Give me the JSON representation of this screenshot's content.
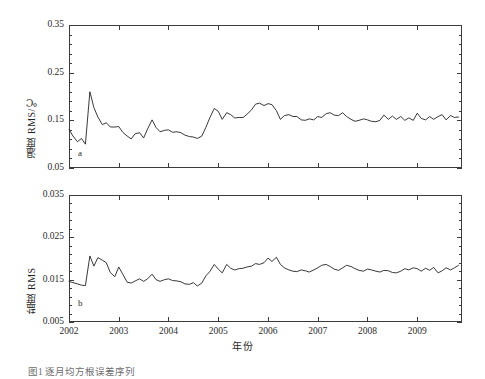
{
  "figure": {
    "background": "#ffffff",
    "line_color": "#222222",
    "axis_color": "#3b3b3b",
    "xlabel": "年份",
    "caption": "图1  逐月均方根误差序列",
    "panels": [
      {
        "letter": "a",
        "ylabel": "温度 RMS/℃"
      },
      {
        "letter": "b",
        "ylabel": "盐度 RMS"
      }
    ]
  },
  "chart_data": [
    {
      "type": "line",
      "title": "",
      "panel": "a",
      "xlabel": "年份",
      "ylabel": "温度 RMS/℃",
      "xlim": [
        2002.0,
        2009.9
      ],
      "ylim": [
        0.05,
        0.35
      ],
      "yticks": [
        0.05,
        0.15,
        0.25,
        0.35
      ],
      "ytick_labels": [
        "0.05",
        "0.15",
        "0.25",
        "0.35"
      ],
      "yticks_minor_step": 0.02,
      "xticks": [
        2002,
        2003,
        2004,
        2005,
        2006,
        2007,
        2008,
        2009
      ],
      "xtick_labels": [
        "2002",
        "2003",
        "2004",
        "2005",
        "2006",
        "2007",
        "2008",
        "2009"
      ],
      "grid": false,
      "legend": null,
      "series": [
        {
          "name": "温度 RMS",
          "x": [
            2002.0,
            2002.08,
            2002.17,
            2002.25,
            2002.33,
            2002.42,
            2002.5,
            2002.58,
            2002.67,
            2002.75,
            2002.83,
            2002.92,
            2003.0,
            2003.08,
            2003.17,
            2003.25,
            2003.33,
            2003.42,
            2003.5,
            2003.58,
            2003.67,
            2003.75,
            2003.83,
            2003.92,
            2004.0,
            2004.08,
            2004.17,
            2004.25,
            2004.33,
            2004.42,
            2004.5,
            2004.58,
            2004.67,
            2004.75,
            2004.83,
            2004.92,
            2005.0,
            2005.08,
            2005.17,
            2005.25,
            2005.33,
            2005.42,
            2005.5,
            2005.58,
            2005.67,
            2005.75,
            2005.83,
            2005.92,
            2006.0,
            2006.08,
            2006.17,
            2006.25,
            2006.33,
            2006.42,
            2006.5,
            2006.58,
            2006.67,
            2006.75,
            2006.83,
            2006.92,
            2007.0,
            2007.08,
            2007.17,
            2007.25,
            2007.33,
            2007.42,
            2007.5,
            2007.58,
            2007.67,
            2007.75,
            2007.83,
            2007.92,
            2008.0,
            2008.08,
            2008.17,
            2008.25,
            2008.33,
            2008.42,
            2008.5,
            2008.58,
            2008.67,
            2008.75,
            2008.83,
            2008.92,
            2009.0,
            2009.08,
            2009.17,
            2009.25,
            2009.33,
            2009.42,
            2009.5,
            2009.58,
            2009.67,
            2009.75,
            2009.83
          ],
          "values": [
            0.131,
            0.117,
            0.105,
            0.112,
            0.1,
            0.21,
            0.177,
            0.157,
            0.141,
            0.145,
            0.136,
            0.136,
            0.137,
            0.125,
            0.117,
            0.111,
            0.122,
            0.124,
            0.113,
            0.132,
            0.151,
            0.135,
            0.126,
            0.129,
            0.13,
            0.125,
            0.126,
            0.124,
            0.119,
            0.116,
            0.115,
            0.112,
            0.117,
            0.135,
            0.155,
            0.175,
            0.169,
            0.152,
            0.166,
            0.162,
            0.155,
            0.156,
            0.156,
            0.163,
            0.172,
            0.184,
            0.186,
            0.181,
            0.185,
            0.183,
            0.17,
            0.152,
            0.16,
            0.162,
            0.158,
            0.158,
            0.151,
            0.15,
            0.153,
            0.151,
            0.158,
            0.156,
            0.164,
            0.166,
            0.161,
            0.16,
            0.166,
            0.158,
            0.152,
            0.148,
            0.15,
            0.153,
            0.151,
            0.148,
            0.147,
            0.15,
            0.161,
            0.152,
            0.159,
            0.152,
            0.158,
            0.15,
            0.155,
            0.15,
            0.165,
            0.154,
            0.151,
            0.158,
            0.152,
            0.158,
            0.162,
            0.151,
            0.16,
            0.156,
            0.157
          ]
        }
      ]
    },
    {
      "type": "line",
      "title": "",
      "panel": "b",
      "xlabel": "年份",
      "ylabel": "盐度 RMS",
      "xlim": [
        2002.0,
        2009.9
      ],
      "ylim": [
        0.005,
        0.035
      ],
      "yticks": [
        0.005,
        0.015,
        0.025,
        0.035
      ],
      "ytick_labels": [
        "0.005",
        "0.015",
        "0.025",
        "0.035"
      ],
      "yticks_minor_step": 0.002,
      "xticks": [
        2002,
        2003,
        2004,
        2005,
        2006,
        2007,
        2008,
        2009
      ],
      "xtick_labels": [
        "2002",
        "2003",
        "2004",
        "2005",
        "2006",
        "2007",
        "2008",
        "2009"
      ],
      "grid": false,
      "legend": null,
      "series": [
        {
          "name": "盐度 RMS",
          "x": [
            2002.0,
            2002.08,
            2002.17,
            2002.25,
            2002.33,
            2002.42,
            2002.5,
            2002.58,
            2002.67,
            2002.75,
            2002.83,
            2002.92,
            2003.0,
            2003.08,
            2003.17,
            2003.25,
            2003.33,
            2003.42,
            2003.5,
            2003.58,
            2003.67,
            2003.75,
            2003.83,
            2003.92,
            2004.0,
            2004.08,
            2004.17,
            2004.25,
            2004.33,
            2004.42,
            2004.5,
            2004.58,
            2004.67,
            2004.75,
            2004.83,
            2004.92,
            2005.0,
            2005.08,
            2005.17,
            2005.25,
            2005.33,
            2005.42,
            2005.5,
            2005.58,
            2005.67,
            2005.75,
            2005.83,
            2005.92,
            2006.0,
            2006.08,
            2006.17,
            2006.25,
            2006.33,
            2006.42,
            2006.5,
            2006.58,
            2006.67,
            2006.75,
            2006.83,
            2006.92,
            2007.0,
            2007.08,
            2007.17,
            2007.25,
            2007.33,
            2007.42,
            2007.5,
            2007.58,
            2007.67,
            2007.75,
            2007.83,
            2007.92,
            2008.0,
            2008.08,
            2008.17,
            2008.25,
            2008.33,
            2008.42,
            2008.5,
            2008.58,
            2008.67,
            2008.75,
            2008.83,
            2008.92,
            2009.0,
            2009.08,
            2009.17,
            2009.25,
            2009.33,
            2009.42,
            2009.5,
            2009.58,
            2009.67,
            2009.75,
            2009.83
          ],
          "values": [
            0.0146,
            0.0143,
            0.014,
            0.0137,
            0.0136,
            0.0206,
            0.0182,
            0.0202,
            0.0196,
            0.019,
            0.0167,
            0.0157,
            0.018,
            0.0163,
            0.0144,
            0.0142,
            0.0147,
            0.0152,
            0.0146,
            0.0152,
            0.0163,
            0.015,
            0.0146,
            0.015,
            0.0152,
            0.0148,
            0.0147,
            0.0145,
            0.014,
            0.0139,
            0.0143,
            0.0135,
            0.0142,
            0.0159,
            0.0169,
            0.0186,
            0.0175,
            0.0166,
            0.0186,
            0.0177,
            0.0173,
            0.0176,
            0.0177,
            0.018,
            0.0182,
            0.0188,
            0.0186,
            0.019,
            0.0201,
            0.0193,
            0.0203,
            0.0186,
            0.0178,
            0.0173,
            0.017,
            0.0169,
            0.0173,
            0.0171,
            0.0168,
            0.0173,
            0.0178,
            0.0184,
            0.0186,
            0.0181,
            0.0175,
            0.0172,
            0.0178,
            0.0184,
            0.0181,
            0.0176,
            0.0172,
            0.017,
            0.0175,
            0.0173,
            0.017,
            0.0168,
            0.0172,
            0.0171,
            0.0167,
            0.0166,
            0.017,
            0.0176,
            0.0173,
            0.0178,
            0.0176,
            0.017,
            0.0177,
            0.0172,
            0.0179,
            0.0166,
            0.0171,
            0.0178,
            0.0173,
            0.0178,
            0.0184
          ]
        }
      ]
    }
  ]
}
